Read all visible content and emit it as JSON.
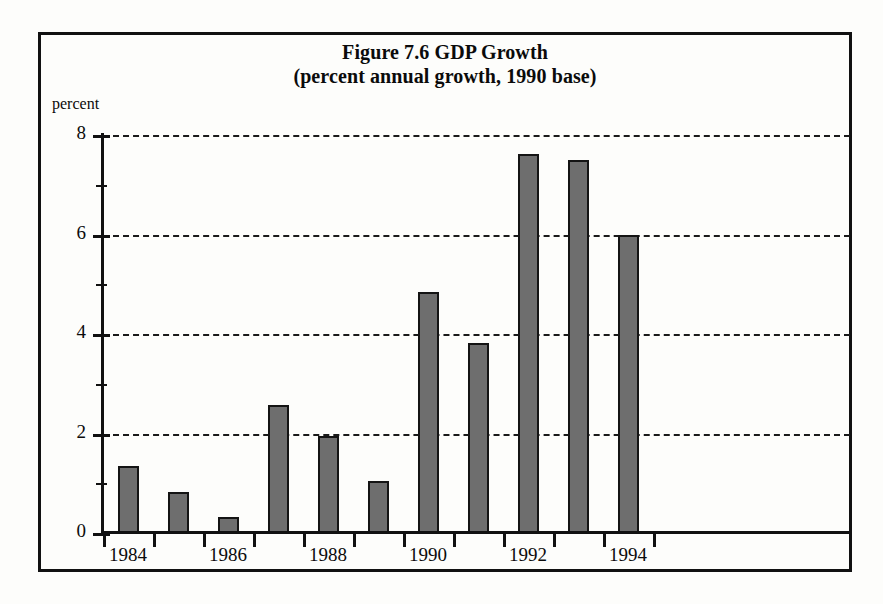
{
  "figure": {
    "title_line1": "Figure 7.6 GDP Growth",
    "title_line2": "(percent annual growth, 1990 base)",
    "y_axis_title": "percent"
  },
  "chart_data": {
    "type": "bar",
    "title": "Figure 7.6 GDP Growth",
    "subtitle": "(percent annual growth, 1990 base)",
    "xlabel": "",
    "ylabel": "percent",
    "ylim": [
      0,
      8
    ],
    "ytick_values": [
      0,
      2,
      4,
      6,
      8
    ],
    "ytick_labels": [
      "0",
      "2",
      "4",
      "6",
      "8"
    ],
    "yminor_values": [
      1,
      3,
      5,
      7
    ],
    "grid": "horizontal-dashed",
    "legend": "none",
    "categories": [
      "1984",
      "1985",
      "1986",
      "1987",
      "1988",
      "1989",
      "1990",
      "1991",
      "1992",
      "1993",
      "1994"
    ],
    "xtick_labels_shown": [
      "1984",
      "1986",
      "1988",
      "1990",
      "1992",
      "1994"
    ],
    "values": [
      1.35,
      0.82,
      0.32,
      2.57,
      1.95,
      1.05,
      4.85,
      3.82,
      7.62,
      7.5,
      6.0
    ],
    "bar_color": "#b9b9b9",
    "bar_edge_color": "#141414",
    "background_color": "#fdfdfb"
  }
}
